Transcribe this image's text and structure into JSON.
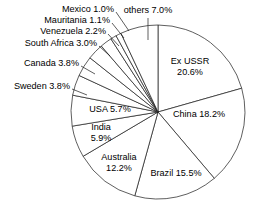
{
  "chart_data": {
    "type": "pie",
    "title": "",
    "subtitle": "",
    "xlabel": "",
    "ylabel": "",
    "legend": "none",
    "grid": false,
    "units": "percent",
    "total": 100.0,
    "start_angle_deg": 0,
    "direction": "clockwise",
    "categories": [
      "Ex USSR",
      "China",
      "Brazil",
      "Australia",
      "India",
      "USA",
      "Sweden",
      "Canada",
      "South Africa",
      "Venezuela",
      "Mauritania",
      "Mexico",
      "others"
    ],
    "values": [
      20.6,
      18.2,
      15.5,
      12.2,
      5.9,
      5.7,
      3.8,
      3.8,
      3.0,
      2.2,
      1.1,
      1.0,
      7.0
    ],
    "slices": [
      {
        "name": "Ex USSR",
        "value": 20.6,
        "label_line1": "Ex USSR",
        "label_line2": "20.6%",
        "label_full": "Ex USSR 20.6%",
        "label_x": 190,
        "label_y": 62,
        "label_anchor": "middle",
        "two_line": true,
        "leader": false
      },
      {
        "name": "China",
        "value": 18.2,
        "label_line1": "China 18.2%",
        "label_line2": "",
        "label_full": "China 18.2%",
        "label_x": 199,
        "label_y": 115,
        "label_anchor": "middle",
        "two_line": false,
        "leader": false
      },
      {
        "name": "Brazil",
        "value": 15.5,
        "label_line1": "Brazil 15.5%",
        "label_line2": "",
        "label_full": "Brazil 15.5%",
        "label_x": 176,
        "label_y": 174,
        "label_anchor": "middle",
        "two_line": false,
        "leader": false
      },
      {
        "name": "Australia",
        "value": 12.2,
        "label_line1": "Australia",
        "label_line2": "12.2%",
        "label_full": "Australia 12.2%",
        "label_x": 119,
        "label_y": 158,
        "label_anchor": "middle",
        "two_line": true,
        "leader": false
      },
      {
        "name": "India",
        "value": 5.9,
        "label_line1": "India",
        "label_line2": "5.9%",
        "label_full": "India 5.9%",
        "label_x": 101,
        "label_y": 128,
        "label_anchor": "middle",
        "two_line": true,
        "leader": false
      },
      {
        "name": "USA",
        "value": 5.7,
        "label_line1": "USA 5.7%",
        "label_line2": "",
        "label_full": "USA 5.7%",
        "label_x": 110,
        "label_y": 110,
        "label_anchor": "middle",
        "two_line": false,
        "leader": false
      },
      {
        "name": "Sweden",
        "value": 3.8,
        "label_line1": "Sweden 3.8%",
        "label_line2": "",
        "label_full": "Sweden 3.8%",
        "label_x": 70,
        "label_y": 87,
        "label_anchor": "end",
        "two_line": false,
        "leader": true,
        "leader_x1": 72,
        "leader_y1": 89,
        "leader_x2": 87,
        "leader_y2": 95
      },
      {
        "name": "Canada",
        "value": 3.8,
        "label_line1": "Canada 3.8%",
        "label_line2": "",
        "label_full": "Canada 3.8%",
        "label_x": 79,
        "label_y": 64,
        "label_anchor": "end",
        "two_line": false,
        "leader": true,
        "leader_x1": 81,
        "leader_y1": 66,
        "leader_x2": 95,
        "leader_y2": 74
      },
      {
        "name": "South Africa",
        "value": 3.0,
        "label_line1": "South Africa 3.0%",
        "label_line2": "",
        "label_full": "South Africa 3.0%",
        "label_x": 97,
        "label_y": 44,
        "label_anchor": "end",
        "two_line": false,
        "leader": true,
        "leader_x1": 99,
        "leader_y1": 46,
        "leader_x2": 110,
        "leader_y2": 56
      },
      {
        "name": "Venezuela",
        "value": 2.2,
        "label_line1": "Venezuela 2.2%",
        "label_line2": "",
        "label_full": "Venezuela 2.2%",
        "label_x": 106,
        "label_y": 32,
        "label_anchor": "end",
        "two_line": false,
        "leader": true,
        "leader_x1": 108,
        "leader_y1": 34,
        "leader_x2": 119,
        "leader_y2": 46
      },
      {
        "name": "Mauritania",
        "value": 1.1,
        "label_line1": "Mauritania 1.1%",
        "label_line2": "",
        "label_full": "Mauritania 1.1%",
        "label_x": 110,
        "label_y": 21,
        "label_anchor": "end",
        "two_line": false,
        "leader": true,
        "leader_x1": 112,
        "leader_y1": 23,
        "leader_x2": 124,
        "leader_y2": 38
      },
      {
        "name": "Mexico",
        "value": 1.0,
        "label_line1": "Mexico 1.0%",
        "label_line2": "",
        "label_full": "Mexico 1.0%",
        "label_x": 114,
        "label_y": 10,
        "label_anchor": "end",
        "two_line": false,
        "leader": true,
        "leader_x1": 116,
        "leader_y1": 12,
        "leader_x2": 129,
        "leader_y2": 31
      },
      {
        "name": "others",
        "value": 7.0,
        "label_line1": "others 7.0%",
        "label_line2": "",
        "label_full": "others 7.0%",
        "label_x": 148,
        "label_y": 11,
        "label_anchor": "middle",
        "two_line": false,
        "leader": true,
        "leader_x1": 148,
        "leader_y1": 18,
        "leader_x2": 148,
        "leader_y2": 40
      }
    ],
    "geometry": {
      "center_x": 158,
      "center_y": 112,
      "radius": 87
    },
    "colors": {
      "slice_fill": "#ffffff",
      "slice_stroke": "#1a1a1a",
      "text": "#000000",
      "background": "#ffffff"
    }
  }
}
